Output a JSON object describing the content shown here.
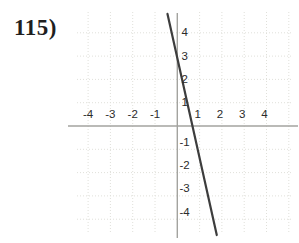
{
  "problem": {
    "number_label": "115)"
  },
  "chart_data": {
    "type": "line",
    "title": "",
    "xlabel": "",
    "ylabel": "",
    "x_ticks": [
      -4,
      -3,
      -2,
      -1,
      1,
      2,
      3,
      4
    ],
    "y_ticks": [
      4,
      3,
      2,
      1,
      -1,
      -2,
      -3,
      -4
    ],
    "xlim": [
      -4.9,
      5.4
    ],
    "ylim": [
      -4.8,
      4.9
    ],
    "grid": "dotted",
    "legend": "none",
    "series": [
      {
        "name": "graphed-line",
        "points": [
          [
            -0.44,
            4.81
          ],
          [
            1.77,
            -4.68
          ]
        ],
        "slope_estimate": -4.5,
        "y_intercept_estimate": 3,
        "x_intercept_estimate": 0.67,
        "color": "#3d3d3d"
      }
    ]
  },
  "layout": {
    "width": 299,
    "height": 243,
    "origin_x_px": 177.3,
    "origin_y_px": 126,
    "px_per_unit_x": 22.3,
    "px_per_unit_y": 23.3,
    "x_axis_left_px": 68,
    "x_axis_right_px": 298,
    "y_axis_top_px": 13,
    "y_axis_bottom_px": 238,
    "grid_left_px": 77,
    "grid_right_px": 293,
    "grid_top_px": 12,
    "grid_bottom_px": 233,
    "extra_grid_columns": [
      5
    ],
    "x_label_baseline_px": 118,
    "y_label_x_px": 181.5
  },
  "colors": {
    "background": "#ffffff",
    "axis": "#a3a39f",
    "grid": "#e0e0da",
    "tick_text": "#2b2b2b",
    "line": "#3d3d3d",
    "problem_text": "#1f1f1f"
  }
}
